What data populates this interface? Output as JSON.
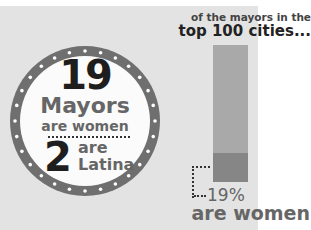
{
  "circle": {
    "count_women": "19",
    "label_mayors": "Mayors",
    "label_are_women": "are women",
    "count_latina": "2",
    "label_are": "are",
    "label_latina": "Latina"
  },
  "bar_panel": {
    "header_line1": "of the mayors in the",
    "header_line2": "top 100 cities...",
    "percent_label": "19%",
    "percent_caption": "are women"
  },
  "colors": {
    "background": "#e3e3e3",
    "ring": "#6f6f6f",
    "bar_total": "#a9a9a9",
    "bar_women": "#868686",
    "text_dark": "#1e1e1e",
    "text_gray": "#666666"
  },
  "chart_data": {
    "type": "bar",
    "categories": [
      "Top 100 city mayors"
    ],
    "series": [
      {
        "name": "Women",
        "values": [
          19
        ]
      },
      {
        "name": "Men",
        "values": [
          81
        ]
      }
    ],
    "stacked": true,
    "annotations": [
      "19% are women",
      "19 Mayors are women",
      "2 are Latina"
    ],
    "ylim": [
      0,
      100
    ]
  }
}
